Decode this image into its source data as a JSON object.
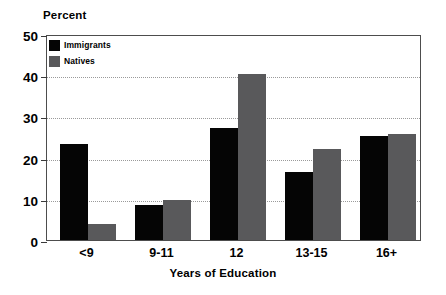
{
  "chart_data": {
    "type": "bar",
    "title": "",
    "xlabel": "Years of Education",
    "ylabel": "Percent",
    "categories": [
      "<9",
      "9-11",
      "12",
      "13-15",
      "16+"
    ],
    "series": [
      {
        "name": "Immigrants",
        "color": "#050505",
        "values": [
          23.4,
          8.5,
          27.3,
          16.5,
          25.3
        ]
      },
      {
        "name": "Natives",
        "color": "#59595b",
        "values": [
          3.9,
          9.7,
          40.3,
          22.0,
          25.8
        ]
      }
    ],
    "ylim": [
      0,
      50
    ],
    "yticks": [
      0,
      10,
      20,
      30,
      40,
      50
    ],
    "ytick_labels": [
      "0",
      "10",
      "20",
      "30",
      "40",
      "50"
    ],
    "grid": "horizontal-dotted",
    "legend_position": "top-left-inside"
  }
}
